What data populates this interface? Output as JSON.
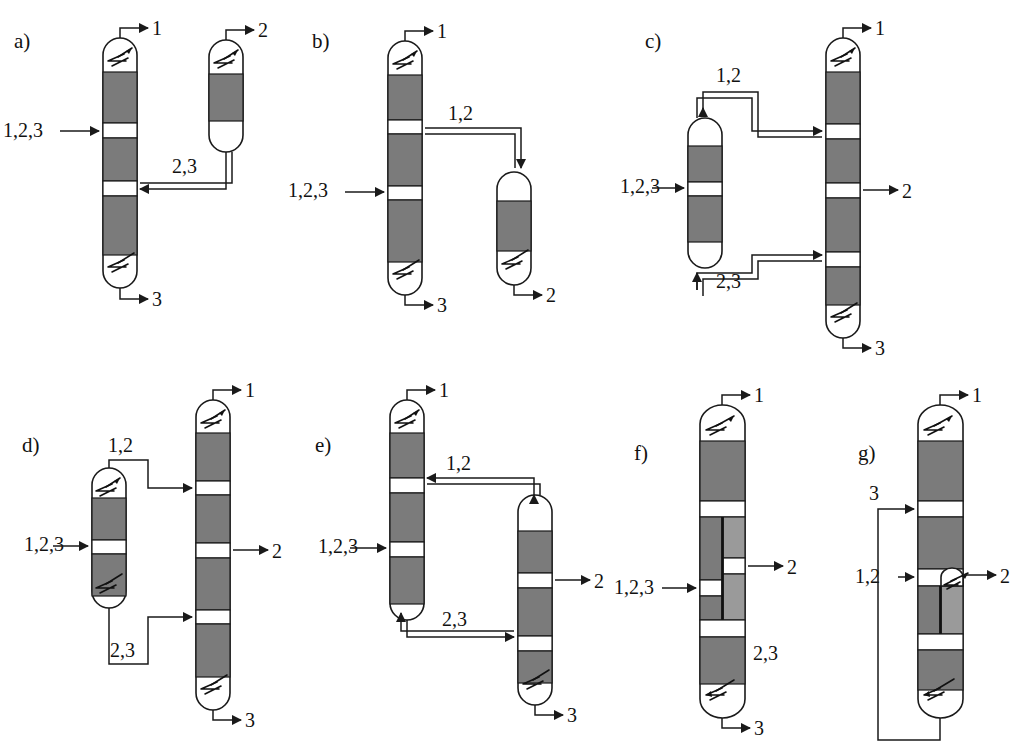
{
  "figure": {
    "component_labels": {
      "feed_ternary": "1,2,3",
      "light": "1",
      "middle": "2",
      "heavy": "3",
      "light_middle": "1,2",
      "middle_heavy": "2,3"
    },
    "colors": {
      "packing_dark": "#7b7b7b",
      "packing_light": "#9a9a9a",
      "outline": "#1a1a1a",
      "background": "#ffffff",
      "wall": "#111111"
    }
  },
  "panels": [
    {
      "id": "a",
      "letter": "a)",
      "name": "direct-sequence-with-side-rectifier",
      "streams": [
        {
          "name": "feed",
          "label": "1,2,3"
        },
        {
          "name": "distillate-main",
          "label": "1"
        },
        {
          "name": "distillate-side",
          "label": "2"
        },
        {
          "name": "bottoms-main",
          "label": "3"
        },
        {
          "name": "interconnect-vapour",
          "label": "2,3"
        }
      ]
    },
    {
      "id": "b",
      "letter": "b)",
      "name": "indirect-sequence-with-side-stripper",
      "streams": [
        {
          "name": "feed",
          "label": "1,2,3"
        },
        {
          "name": "distillate-main",
          "label": "1"
        },
        {
          "name": "bottoms-side",
          "label": "2"
        },
        {
          "name": "bottoms-main",
          "label": "3"
        },
        {
          "name": "interconnect-liquid",
          "label": "1,2"
        }
      ]
    },
    {
      "id": "c",
      "letter": "c)",
      "name": "petlyuk-prefractionator-arrangement",
      "streams": [
        {
          "name": "feed",
          "label": "1,2,3"
        },
        {
          "name": "distillate",
          "label": "1"
        },
        {
          "name": "side-draw",
          "label": "2"
        },
        {
          "name": "bottoms",
          "label": "3"
        },
        {
          "name": "upper-interconnect",
          "label": "1,2"
        },
        {
          "name": "lower-interconnect",
          "label": "2,3"
        }
      ]
    },
    {
      "id": "d",
      "letter": "d)",
      "name": "prefractionator-with-own-condenser-and-reboiler",
      "streams": [
        {
          "name": "feed",
          "label": "1,2,3"
        },
        {
          "name": "distillate",
          "label": "1"
        },
        {
          "name": "side-draw",
          "label": "2"
        },
        {
          "name": "bottoms",
          "label": "3"
        },
        {
          "name": "upper-transfer",
          "label": "1,2"
        },
        {
          "name": "lower-transfer",
          "label": "2,3"
        }
      ]
    },
    {
      "id": "e",
      "letter": "e)",
      "name": "side-column-with-two-way-coupling",
      "streams": [
        {
          "name": "feed",
          "label": "1,2,3"
        },
        {
          "name": "distillate",
          "label": "1"
        },
        {
          "name": "side-draw",
          "label": "2"
        },
        {
          "name": "bottoms",
          "label": "3"
        },
        {
          "name": "upper-return",
          "label": "1,2"
        },
        {
          "name": "lower-transfer",
          "label": "2,3"
        }
      ]
    },
    {
      "id": "f",
      "letter": "f)",
      "name": "dividing-wall-column",
      "streams": [
        {
          "name": "feed",
          "label": "1,2,3"
        },
        {
          "name": "distillate",
          "label": "1"
        },
        {
          "name": "side-draw",
          "label": "2"
        },
        {
          "name": "bottoms",
          "label": "3"
        },
        {
          "name": "lower-section",
          "label": "2,3"
        }
      ]
    },
    {
      "id": "g",
      "letter": "g)",
      "name": "dividing-wall-column-with-bottoms-recycle",
      "streams": [
        {
          "name": "recycle",
          "label": "3"
        },
        {
          "name": "feed",
          "label": "1,2"
        },
        {
          "name": "distillate",
          "label": "1"
        },
        {
          "name": "side-condenser-draw",
          "label": "2"
        }
      ]
    }
  ]
}
